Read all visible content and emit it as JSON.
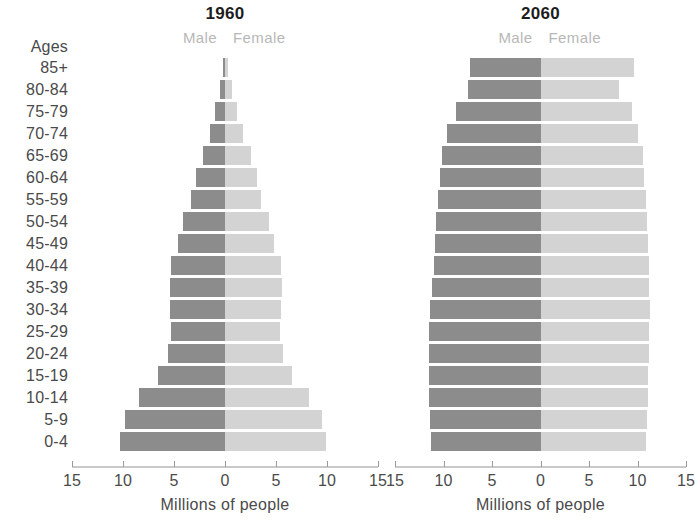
{
  "ages_header": "Ages",
  "age_groups": [
    "85+",
    "80-84",
    "75-79",
    "70-74",
    "65-69",
    "60-64",
    "55-59",
    "50-54",
    "45-49",
    "40-44",
    "35-39",
    "30-34",
    "25-29",
    "20-24",
    "15-19",
    "10-14",
    "5-9",
    "0-4"
  ],
  "legend": {
    "male": "Male",
    "female": "Female"
  },
  "axis": {
    "title": "Millions of people",
    "tick_labels": [
      "15",
      "10",
      "5",
      "0",
      "5",
      "10",
      "15"
    ],
    "tick_values": [
      -15,
      -10,
      -5,
      0,
      5,
      10,
      15
    ],
    "limit": 15
  },
  "colors": {
    "male_bar": "#8c8c8c",
    "female_bar": "#d3d3d3",
    "text": "#4a4a4a",
    "title_text": "#1d1d1d",
    "legend_text": "#b7b7b7",
    "axis_line": "#c9c9c9"
  },
  "panels": [
    {
      "id": "1960",
      "title": "1960"
    },
    {
      "id": "2060",
      "title": "2060"
    }
  ],
  "chart_data": [
    {
      "type": "bar",
      "title": "1960",
      "subtitle": "Male / Female population pyramid",
      "orientation": "horizontal-diverging",
      "xlabel": "Millions of people",
      "ylabel": "Ages",
      "xlim": [
        -15,
        15
      ],
      "xticks": [
        -15,
        -10,
        -5,
        0,
        5,
        10,
        15
      ],
      "xticklabels": [
        "15",
        "10",
        "5",
        "0",
        "5",
        "10",
        "15"
      ],
      "grid": false,
      "legend": [
        "Male",
        "Female"
      ],
      "legend_position": "top-center",
      "categories": [
        "85+",
        "80-84",
        "75-79",
        "70-74",
        "65-69",
        "60-64",
        "55-59",
        "50-54",
        "45-49",
        "40-44",
        "35-39",
        "30-34",
        "25-29",
        "20-24",
        "15-19",
        "10-14",
        "5-9",
        "0-4"
      ],
      "series": [
        {
          "name": "Male",
          "values": [
            0.2,
            0.5,
            1.0,
            1.5,
            2.2,
            2.8,
            3.3,
            4.1,
            4.6,
            5.3,
            5.4,
            5.4,
            5.3,
            5.6,
            6.6,
            8.4,
            9.8,
            10.3
          ]
        },
        {
          "name": "Female",
          "values": [
            0.3,
            0.7,
            1.2,
            1.8,
            2.5,
            3.1,
            3.5,
            4.3,
            4.8,
            5.5,
            5.6,
            5.5,
            5.4,
            5.7,
            6.6,
            8.2,
            9.5,
            9.9
          ]
        }
      ]
    },
    {
      "type": "bar",
      "title": "2060",
      "subtitle": "Male / Female population pyramid",
      "orientation": "horizontal-diverging",
      "xlabel": "Millions of people",
      "ylabel": "Ages",
      "xlim": [
        -15,
        15
      ],
      "xticks": [
        -15,
        -10,
        -5,
        0,
        5,
        10,
        15
      ],
      "xticklabels": [
        "15",
        "10",
        "5",
        "0",
        "5",
        "10",
        "15"
      ],
      "grid": false,
      "legend": [
        "Male",
        "Female"
      ],
      "legend_position": "top-center",
      "categories": [
        "85+",
        "80-84",
        "75-79",
        "70-74",
        "65-69",
        "60-64",
        "55-59",
        "50-54",
        "45-49",
        "40-44",
        "35-39",
        "30-34",
        "25-29",
        "20-24",
        "15-19",
        "10-14",
        "5-9",
        "0-4"
      ],
      "series": [
        {
          "name": "Male",
          "values": [
            7.3,
            7.5,
            8.7,
            9.6,
            10.2,
            10.4,
            10.6,
            10.8,
            10.9,
            11.0,
            11.2,
            11.4,
            11.5,
            11.5,
            11.5,
            11.5,
            11.4,
            11.3
          ]
        },
        {
          "name": "Female",
          "values": [
            9.6,
            8.1,
            9.4,
            10.0,
            10.6,
            10.7,
            10.9,
            11.0,
            11.1,
            11.2,
            11.2,
            11.3,
            11.2,
            11.2,
            11.1,
            11.1,
            11.0,
            10.9
          ]
        }
      ]
    }
  ]
}
